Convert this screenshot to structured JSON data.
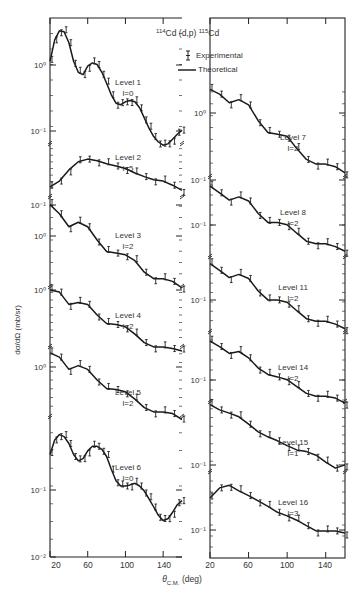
{
  "chart_data": {
    "type": "line",
    "title": "114Cd (d,p) 115Cd",
    "title_parts": {
      "a_mass": "114",
      "a_el": "Cd",
      "reaction": "(d,p)",
      "b_mass": "115",
      "b_el": "Cd"
    },
    "xlabel": "θ C.M. (deg)",
    "xlabel_parts": {
      "theta": "θ",
      "sub": "C.M.",
      "unit": "(deg)"
    },
    "ylabel": "dσ/dΩ (mb/sr)",
    "xlim": [
      20,
      160
    ],
    "xticks": [
      20,
      60,
      100,
      140
    ],
    "legend": [
      {
        "symbol": "error-bar",
        "label": "Experimental"
      },
      {
        "symbol": "line",
        "label": "Theoretical"
      }
    ],
    "panels": [
      {
        "column": "left",
        "curves": [
          {
            "level": "Level 1",
            "l": "l=0",
            "ytick_label": "10⁰",
            "ytick2_label": "10⁻¹",
            "x": [
              20,
              25,
              30,
              35,
              40,
              45,
              50,
              55,
              60,
              65,
              70,
              75,
              80,
              85,
              90,
              95,
              100,
              105,
              110,
              115,
              120,
              125,
              130,
              135,
              140,
              145,
              150,
              155,
              160
            ],
            "y": [
              0.9,
              2.0,
              2.8,
              2.7,
              1.8,
              0.9,
              0.6,
              0.55,
              0.75,
              0.85,
              0.8,
              0.6,
              0.4,
              0.26,
              0.19,
              0.18,
              0.2,
              0.21,
              0.2,
              0.16,
              0.11,
              0.075,
              0.055,
              0.045,
              0.04,
              0.042,
              0.05,
              0.06,
              0.07
            ]
          },
          {
            "level": "Level 2",
            "l": "l=5",
            "ytick_label": "10⁻¹",
            "x": [
              20,
              30,
              40,
              50,
              60,
              70,
              80,
              90,
              100,
              110,
              120,
              130,
              140,
              150,
              160
            ],
            "y": [
              0.12,
              0.16,
              0.28,
              0.42,
              0.48,
              0.44,
              0.38,
              0.34,
              0.3,
              0.24,
              0.2,
              0.17,
              0.16,
              0.13,
              0.1
            ]
          },
          {
            "level": "Level 3",
            "l": "l=2",
            "ytick_label": "10⁰",
            "x": [
              20,
              30,
              40,
              50,
              60,
              70,
              80,
              90,
              100,
              110,
              120,
              130,
              140,
              150,
              160
            ],
            "y": [
              2.4,
              1.6,
              0.9,
              1.1,
              0.9,
              0.5,
              0.3,
              0.28,
              0.26,
              0.2,
              0.12,
              0.09,
              0.09,
              0.08,
              0.06
            ]
          },
          {
            "level": "Level 4",
            "l": "l=2",
            "ytick_label": "10⁰",
            "x": [
              20,
              30,
              40,
              50,
              60,
              70,
              80,
              90,
              100,
              110,
              120,
              130,
              140,
              150,
              160
            ],
            "y": [
              1.0,
              0.9,
              0.5,
              0.55,
              0.5,
              0.3,
              0.2,
              0.19,
              0.17,
              0.12,
              0.08,
              0.065,
              0.065,
              0.06,
              0.045
            ]
          },
          {
            "level": "Level 5",
            "l": "l=2",
            "ytick_label": "10⁰",
            "x": [
              20,
              30,
              40,
              50,
              60,
              70,
              80,
              90,
              100,
              110,
              120,
              130,
              140,
              150,
              160
            ],
            "y": [
              1.1,
              0.9,
              0.5,
              0.6,
              0.5,
              0.3,
              0.2,
              0.19,
              0.17,
              0.12,
              0.08,
              0.065,
              0.065,
              0.06,
              0.045
            ]
          },
          {
            "level": "Level 6",
            "l": "l=0",
            "ytick_label": "10⁻¹",
            "ytick2_label": "10⁻²",
            "x": [
              20,
              25,
              30,
              35,
              40,
              45,
              50,
              55,
              60,
              65,
              70,
              75,
              80,
              85,
              90,
              95,
              100,
              105,
              110,
              115,
              120,
              125,
              130,
              135,
              140,
              145,
              150,
              155,
              160
            ],
            "y": [
              0.15,
              0.25,
              0.3,
              0.28,
              0.22,
              0.15,
              0.12,
              0.13,
              0.17,
              0.2,
              0.2,
              0.18,
              0.14,
              0.09,
              0.06,
              0.05,
              0.05,
              0.052,
              0.055,
              0.05,
              0.042,
              0.032,
              0.024,
              0.018,
              0.015,
              0.016,
              0.02,
              0.026,
              0.03
            ]
          }
        ]
      },
      {
        "column": "right",
        "curves": [
          {
            "level": "Level 7",
            "l": "l=2",
            "ytick_label": "10⁰",
            "ytick2_label": "10⁻¹",
            "x": [
              20,
              30,
              40,
              50,
              60,
              70,
              80,
              90,
              100,
              110,
              120,
              130,
              140,
              150,
              160
            ],
            "y": [
              0.7,
              0.6,
              0.45,
              0.5,
              0.42,
              0.25,
              0.17,
              0.16,
              0.15,
              0.1,
              0.07,
              0.06,
              0.06,
              0.055,
              0.045
            ]
          },
          {
            "level": "Level 8",
            "l": "l=2",
            "ytick_label": "10⁻¹",
            "x": [
              20,
              30,
              40,
              50,
              60,
              70,
              80,
              90,
              100,
              110,
              120,
              130,
              140,
              150,
              160
            ],
            "y": [
              0.5,
              0.38,
              0.28,
              0.32,
              0.27,
              0.16,
              0.11,
              0.11,
              0.1,
              0.07,
              0.05,
              0.045,
              0.045,
              0.04,
              0.033
            ]
          },
          {
            "level": "Level 11",
            "l": "l=2",
            "ytick_label": "10⁻¹",
            "x": [
              20,
              30,
              40,
              50,
              60,
              70,
              80,
              90,
              100,
              110,
              120,
              130,
              140,
              150,
              160
            ],
            "y": [
              0.5,
              0.38,
              0.28,
              0.32,
              0.27,
              0.16,
              0.11,
              0.11,
              0.1,
              0.07,
              0.05,
              0.045,
              0.045,
              0.04,
              0.033
            ]
          },
          {
            "level": "Level 14",
            "l": "l=2",
            "ytick_label": "10⁻¹",
            "x": [
              20,
              30,
              40,
              50,
              60,
              70,
              80,
              90,
              100,
              110,
              120,
              130,
              140,
              150,
              160
            ],
            "y": [
              0.4,
              0.32,
              0.24,
              0.26,
              0.2,
              0.13,
              0.1,
              0.09,
              0.08,
              0.06,
              0.045,
              0.04,
              0.04,
              0.037,
              0.03
            ]
          },
          {
            "level": "Level 15",
            "l": "l=1",
            "ytick_label": "10⁻¹",
            "x": [
              20,
              30,
              40,
              50,
              60,
              70,
              80,
              90,
              100,
              110,
              120,
              130,
              140,
              150,
              160
            ],
            "y": [
              0.5,
              0.4,
              0.35,
              0.3,
              0.22,
              0.16,
              0.13,
              0.11,
              0.09,
              0.075,
              0.07,
              0.06,
              0.045,
              0.035,
              0.04
            ]
          },
          {
            "level": "Level 16",
            "l": "l=3",
            "ytick_label": "10⁻¹",
            "x": [
              20,
              30,
              40,
              50,
              60,
              70,
              80,
              90,
              100,
              110,
              120,
              130,
              140,
              150,
              160
            ],
            "y": [
              0.25,
              0.4,
              0.45,
              0.35,
              0.28,
              0.22,
              0.17,
              0.13,
              0.11,
              0.09,
              0.07,
              0.055,
              0.055,
              0.055,
              0.05
            ]
          }
        ]
      }
    ]
  }
}
